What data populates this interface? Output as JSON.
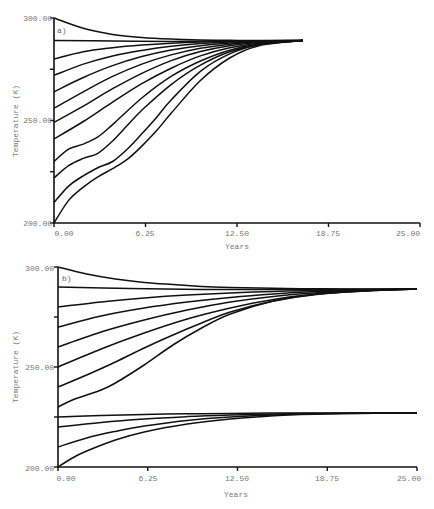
{
  "chart_data": [
    {
      "type": "line",
      "panel_label": "a)",
      "xlabel": "Years",
      "ylabel": "Temperature (K)",
      "xlim": [
        0,
        25
      ],
      "ylim": [
        200,
        300
      ],
      "x_ticks": [
        "0.00",
        "6.25",
        "12.50",
        "18.75",
        "25.00"
      ],
      "y_ticks": [
        "200.00",
        "250.00",
        "300.00"
      ],
      "grid": false,
      "equilibrium": 289,
      "series": [
        {
          "name": "T0=300",
          "start": 300,
          "x": [
            0,
            2,
            4,
            6,
            8,
            10,
            12,
            14,
            17
          ],
          "y": [
            300,
            295,
            292,
            290.5,
            289.7,
            289.3,
            289.1,
            289,
            289
          ]
        },
        {
          "name": "T0=289",
          "start": 289,
          "x": [
            0,
            4,
            8,
            12,
            17
          ],
          "y": [
            289,
            288.8,
            288.6,
            288.8,
            289
          ]
        },
        {
          "name": "T0=280",
          "start": 280,
          "x": [
            0,
            2,
            4,
            6,
            8,
            10,
            12,
            14,
            17
          ],
          "y": [
            280,
            283.5,
            285.5,
            286.8,
            287.7,
            288.3,
            288.7,
            288.9,
            289
          ]
        },
        {
          "name": "T0=272",
          "start": 272,
          "x": [
            0,
            2,
            4,
            6,
            8,
            10,
            12,
            14,
            17
          ],
          "y": [
            272,
            277.5,
            281.5,
            284.2,
            286.2,
            287.5,
            288.3,
            288.8,
            289
          ]
        },
        {
          "name": "T0=264",
          "start": 264,
          "x": [
            0,
            2,
            4,
            6,
            8,
            10,
            12,
            14,
            17
          ],
          "y": [
            264,
            271,
            276.8,
            281.2,
            284.4,
            286.5,
            287.8,
            288.6,
            289
          ]
        },
        {
          "name": "T0=256",
          "start": 256,
          "x": [
            0,
            2,
            4,
            6,
            8,
            10,
            12,
            14,
            17
          ],
          "y": [
            256,
            264,
            271.5,
            277.5,
            282,
            285.2,
            287.2,
            288.4,
            289
          ]
        },
        {
          "name": "T0=249",
          "start": 249,
          "x": [
            0,
            2,
            4,
            6,
            8,
            10,
            12,
            14,
            17
          ],
          "y": [
            249,
            257,
            265.5,
            273,
            279.2,
            283.6,
            286.5,
            288.1,
            289
          ]
        },
        {
          "name": "T0=241",
          "start": 241,
          "x": [
            0,
            2,
            4,
            6,
            8,
            10,
            12,
            14,
            17
          ],
          "y": [
            241,
            249.5,
            259,
            268,
            275.5,
            281.5,
            285.5,
            287.7,
            289
          ]
        },
        {
          "name": "T0=230",
          "start": 230,
          "x": [
            0,
            1,
            2,
            3,
            4,
            6,
            8,
            10,
            12,
            14,
            17
          ],
          "y": [
            230,
            236,
            238.5,
            242,
            248,
            261,
            271.5,
            279,
            284.3,
            287.3,
            289
          ]
        },
        {
          "name": "T0=222",
          "start": 222,
          "x": [
            0,
            1,
            2,
            3,
            4,
            5,
            6,
            8,
            10,
            12,
            14,
            17
          ],
          "y": [
            222,
            228,
            231.5,
            234,
            240,
            247.5,
            255,
            267.5,
            277,
            283.5,
            287,
            289
          ]
        },
        {
          "name": "T0=210",
          "start": 210,
          "x": [
            0,
            1,
            2,
            3,
            4,
            5,
            6,
            7,
            8,
            10,
            12,
            14,
            17
          ],
          "y": [
            210,
            218,
            223,
            227,
            230,
            236,
            243.5,
            251.5,
            260,
            274,
            282.5,
            287,
            289
          ]
        },
        {
          "name": "T0=200",
          "start": 200,
          "x": [
            0,
            1,
            2,
            3,
            4,
            5,
            6,
            7,
            8,
            10,
            12,
            14,
            17
          ],
          "y": [
            200,
            211,
            217.5,
            222.5,
            226.5,
            231,
            237.5,
            245,
            253.5,
            269.5,
            280.5,
            286.5,
            289
          ]
        }
      ]
    },
    {
      "type": "line",
      "panel_label": "b)",
      "xlabel": "Years",
      "ylabel": "Temperature (K)",
      "xlim": [
        0,
        25
      ],
      "ylim": [
        200,
        300
      ],
      "x_ticks": [
        "0.00",
        "6.25",
        "12.50",
        "18.75",
        "25.00"
      ],
      "y_ticks": [
        "200.00",
        "250.00",
        "300.00"
      ],
      "grid": false,
      "equilibria": [
        289,
        227
      ],
      "series": [
        {
          "name": "T0=300",
          "x": [
            0,
            2,
            4,
            6,
            8,
            10,
            12,
            15,
            18,
            25
          ],
          "y": [
            300,
            296.5,
            294,
            292.3,
            291.2,
            290.3,
            289.8,
            289.4,
            289.1,
            289
          ]
        },
        {
          "name": "T0=290",
          "x": [
            0,
            5,
            10,
            15,
            20,
            25
          ],
          "y": [
            290,
            289.2,
            288.8,
            288.7,
            288.8,
            289
          ]
        },
        {
          "name": "T0=280",
          "x": [
            0,
            3,
            6,
            9,
            12,
            15,
            18,
            22,
            25
          ],
          "y": [
            280,
            282.5,
            284.5,
            286,
            287,
            287.8,
            288.3,
            288.7,
            289
          ]
        },
        {
          "name": "T0=270",
          "x": [
            0,
            3,
            6,
            9,
            12,
            15,
            18,
            22,
            25
          ],
          "y": [
            270,
            275.5,
            279.5,
            282.5,
            284.8,
            286.5,
            287.7,
            288.5,
            289
          ]
        },
        {
          "name": "T0=260",
          "x": [
            0,
            3,
            6,
            9,
            12,
            15,
            18,
            22,
            25
          ],
          "y": [
            260,
            267.5,
            273.5,
            278.5,
            282.5,
            285.3,
            287.1,
            288.4,
            289
          ]
        },
        {
          "name": "T0=250",
          "x": [
            0,
            3,
            6,
            9,
            12,
            15,
            18,
            22,
            25
          ],
          "y": [
            250,
            259,
            267,
            274,
            279.5,
            283.8,
            286.5,
            288.3,
            289
          ]
        },
        {
          "name": "T0=240",
          "x": [
            0,
            2,
            4,
            6,
            8,
            10,
            12,
            15,
            18,
            22,
            25
          ],
          "y": [
            240,
            246,
            252.5,
            259.5,
            266,
            272,
            277.5,
            283,
            286.3,
            288.3,
            289
          ]
        },
        {
          "name": "T0=230",
          "x": [
            0,
            1,
            2,
            3,
            4,
            6,
            8,
            10,
            12,
            15,
            18,
            22,
            25
          ],
          "y": [
            230,
            233.5,
            236,
            238.5,
            242,
            251,
            261,
            269.5,
            276.5,
            283,
            286.5,
            288.4,
            289
          ]
        },
        {
          "name": "T0=225",
          "x": [
            0,
            3,
            6,
            9,
            12,
            16,
            20,
            25
          ],
          "y": [
            225,
            225.8,
            226.3,
            226.6,
            226.8,
            227,
            227,
            227
          ]
        },
        {
          "name": "T0=220",
          "x": [
            0,
            3,
            6,
            9,
            12,
            16,
            20,
            25
          ],
          "y": [
            220,
            222.3,
            224,
            225.2,
            226,
            226.6,
            226.9,
            227
          ]
        },
        {
          "name": "T0=210",
          "x": [
            0,
            2,
            4,
            6,
            9,
            12,
            16,
            20,
            25
          ],
          "y": [
            210,
            214.5,
            217.8,
            220.5,
            223.3,
            225,
            226.3,
            226.8,
            227
          ]
        },
        {
          "name": "T0=200",
          "x": [
            0,
            1,
            2,
            4,
            6,
            9,
            12,
            16,
            20,
            25
          ],
          "y": [
            200,
            204.5,
            208,
            213.5,
            217.5,
            221.5,
            224,
            226,
            226.8,
            227
          ]
        }
      ]
    }
  ]
}
